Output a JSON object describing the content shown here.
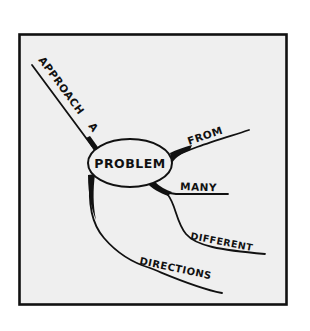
{
  "diagram": {
    "type": "mind-map",
    "style": "hand-drawn sketch",
    "colors": {
      "ink": "#111111",
      "panel_fill": "#efefef",
      "background": "#ffffff"
    },
    "center_node": {
      "label": "PROBLEM"
    },
    "branches": [
      {
        "id": "approach",
        "label": "APPROACH",
        "position": "upper-left"
      },
      {
        "id": "a",
        "label": "A",
        "position": "upper-left"
      },
      {
        "id": "from",
        "label": "FROM",
        "position": "right-upper"
      },
      {
        "id": "many",
        "label": "MANY",
        "position": "right"
      },
      {
        "id": "different",
        "label": "DIFFERENT",
        "position": "lower-right"
      },
      {
        "id": "directions",
        "label": "DIRECTIONS",
        "position": "bottom"
      }
    ],
    "reading": "APPROACH A PROBLEM FROM MANY DIFFERENT DIRECTIONS"
  }
}
